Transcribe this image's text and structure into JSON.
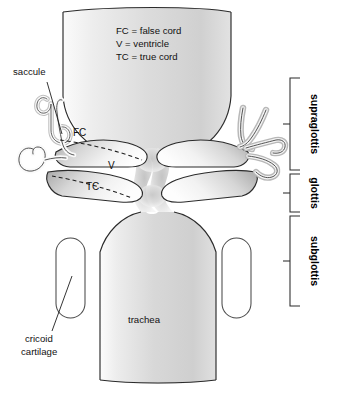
{
  "figure": {
    "width": 339,
    "height": 396,
    "background_color": "#ffffff",
    "outline_color": "#2b2b2b",
    "cavity_fill_color": "#d2d2d2",
    "tissue_fill_color": "#e8e8e8"
  },
  "legend": {
    "lines": [
      "FC = false cord",
      "V = ventricle",
      "TC = true cord"
    ]
  },
  "cord_labels": {
    "false_cord": "FC",
    "ventricle": "V",
    "true_cord": "TC"
  },
  "annotations": {
    "saccule": "saccule",
    "cricoid_line1": "cricoid",
    "cricoid_line2": "cartilage",
    "trachea": "trachea"
  },
  "regions": [
    {
      "label": "supraglottis",
      "top": 78,
      "bottom": 170
    },
    {
      "label": "glottis",
      "top": 174,
      "bottom": 212
    },
    {
      "label": "subglottis",
      "top": 216,
      "bottom": 306
    }
  ]
}
